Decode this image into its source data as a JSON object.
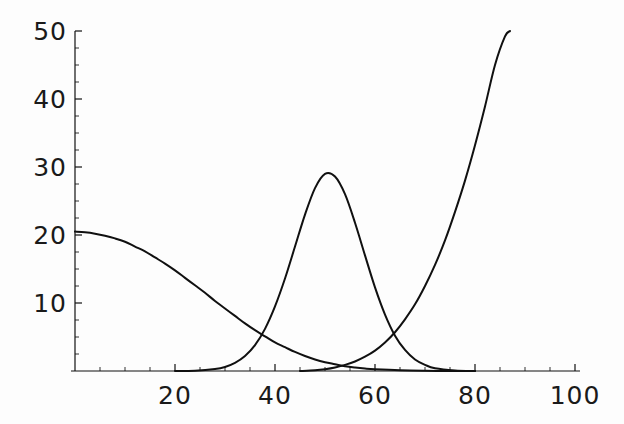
{
  "chart_data": {
    "type": "line",
    "title": "",
    "subtitle": "",
    "xlabel": "",
    "ylabel": "",
    "xlim": [
      0,
      101
    ],
    "ylim": [
      0,
      50
    ],
    "grid": false,
    "legend": null,
    "background_color": "#fdfdfd",
    "curve_color": "#101010",
    "axis_color": "#111111",
    "x_ticks": [
      {
        "value": 20,
        "label": "20"
      },
      {
        "value": 40,
        "label": "40"
      },
      {
        "value": 60,
        "label": "60"
      },
      {
        "value": 80,
        "label": "80"
      },
      {
        "value": 100,
        "label": "100"
      }
    ],
    "x_minor_ticks": [
      5,
      10,
      15,
      25,
      30,
      35,
      45,
      50,
      55,
      65,
      70,
      75,
      85,
      90,
      95
    ],
    "y_ticks": [
      {
        "value": 10,
        "label": "10"
      },
      {
        "value": 20,
        "label": "20"
      },
      {
        "value": 30,
        "label": "30"
      },
      {
        "value": 40,
        "label": "40"
      },
      {
        "value": 50,
        "label": "50"
      }
    ],
    "y_minor_ticks": [
      2.5,
      5,
      7.5,
      12.5,
      15,
      17.5,
      22.5,
      25,
      27.5,
      32.5,
      35,
      37.5,
      42.5,
      45,
      47.5
    ],
    "series": [
      {
        "name": "decaying-curve",
        "style": "solid",
        "x": [
          0,
          2,
          4,
          6,
          8,
          10,
          12,
          14,
          16,
          18,
          20,
          22,
          24,
          26,
          28,
          30,
          32,
          34,
          36,
          38,
          40,
          42,
          44,
          46,
          48,
          50,
          52,
          54,
          56,
          58,
          60,
          65,
          70,
          75,
          80
        ],
        "values": [
          20.5,
          20.4,
          20.2,
          19.9,
          19.5,
          19.0,
          18.3,
          17.6,
          16.7,
          15.8,
          14.8,
          13.7,
          12.6,
          11.5,
          10.3,
          9.2,
          8.1,
          7.0,
          6.0,
          5.1,
          4.2,
          3.5,
          2.8,
          2.2,
          1.7,
          1.3,
          1.0,
          0.7,
          0.5,
          0.35,
          0.25,
          0.1,
          0.03,
          0.0,
          0.0
        ]
      },
      {
        "name": "gaussian-peak-curve",
        "style": "solid",
        "x": [
          20,
          24,
          28,
          30,
          32,
          34,
          36,
          38,
          40,
          42,
          44,
          46,
          48,
          50,
          52,
          54,
          56,
          58,
          60,
          62,
          64,
          66,
          68,
          70,
          72,
          76,
          80
        ],
        "values": [
          0.0,
          0.05,
          0.3,
          0.6,
          1.2,
          2.2,
          3.8,
          6.2,
          9.5,
          13.6,
          18.3,
          23.0,
          26.9,
          29.0,
          28.6,
          26.0,
          21.8,
          17.0,
          12.3,
          8.3,
          5.2,
          3.1,
          1.7,
          0.9,
          0.4,
          0.08,
          0.0
        ]
      },
      {
        "name": "rising-curve",
        "style": "solid",
        "x": [
          45,
          48,
          50,
          52,
          54,
          56,
          58,
          60,
          62,
          64,
          66,
          68,
          70,
          72,
          74,
          76,
          78,
          80,
          82,
          84,
          86,
          87
        ],
        "values": [
          0.0,
          0.1,
          0.25,
          0.5,
          0.9,
          1.4,
          2.1,
          3.0,
          4.2,
          5.7,
          7.6,
          9.8,
          12.5,
          15.6,
          19.2,
          23.4,
          28.0,
          33.2,
          38.9,
          45.0,
          49.2,
          50.0
        ]
      }
    ]
  },
  "figure": {
    "background": "#fdfdfd",
    "axes_origin_px": {
      "x": 75,
      "y": 371
    },
    "px_per_x_unit": 5.0,
    "px_per_y_unit": 6.8
  }
}
